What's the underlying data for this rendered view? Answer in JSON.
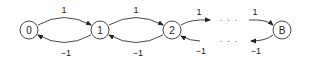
{
  "diagram": {
    "type": "state-transition-chain",
    "nodes": [
      {
        "id": "0",
        "label": "0"
      },
      {
        "id": "1",
        "label": "1"
      },
      {
        "id": "2",
        "label": "2"
      },
      {
        "id": "B",
        "label": "B"
      }
    ],
    "edges": [
      {
        "from": "0",
        "to": "1",
        "label": "1"
      },
      {
        "from": "1",
        "to": "0",
        "label": "−1"
      },
      {
        "from": "1",
        "to": "2",
        "label": "1"
      },
      {
        "from": "2",
        "to": "1",
        "label": "−1"
      },
      {
        "from": "2",
        "to": "…",
        "label": "1"
      },
      {
        "from": "…",
        "to": "2",
        "label": "−1"
      },
      {
        "from": "…",
        "to": "B",
        "label": "1"
      },
      {
        "from": "B",
        "to": "…",
        "label": "−1"
      }
    ],
    "ellipsis": "· · ·"
  }
}
